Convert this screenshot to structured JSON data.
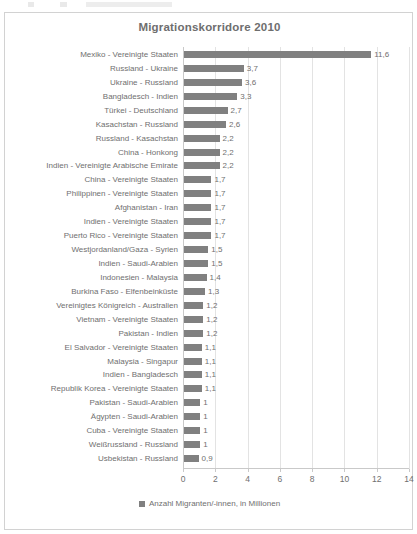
{
  "chart_data": {
    "type": "bar",
    "orientation": "horizontal",
    "title": "Migrationskorridore 2010",
    "xlabel": "",
    "ylabel": "",
    "xlim": [
      0,
      14
    ],
    "xticks": [
      0,
      2,
      4,
      6,
      8,
      10,
      12,
      14
    ],
    "grid": true,
    "legend_position": "bottom",
    "legend": [
      "Anzahl Migranten/-innen, in Millionen"
    ],
    "series_name": "Anzahl Migranten/-innen, in Millionen",
    "bar_color": "#808080",
    "value_decimal_separator": ",",
    "categories": [
      "Mexiko - Vereinigte Staaten",
      "Russland - Ukraine",
      "Ukraine - Russland",
      "Bangladesch - Indien",
      "Türkei - Deutschland",
      "Kasachstan - Russland",
      "Russland - Kasachstan",
      "China - Honkong",
      "Indien - Vereinigte Arabische Emirate",
      "China - Vereinigte Staaten",
      "Philippinen - Vereinigte Staaten",
      "Afghanistan - Iran",
      "Indien - Vereinigte Staaten",
      "Puerto Rico - Vereinigte Staaten",
      "Westjordanland/Gaza - Syrien",
      "Indien - Saudi-Arabien",
      "Indonesien - Malaysia",
      "Burkina Faso - Elfenbeinküste",
      "Vereinigtes Königreich - Australien",
      "Vietnam - Vereinigte Staaten",
      "Pakistan - Indien",
      "El Salvador - Vereinigte Staaten",
      "Malaysia - Singapur",
      "Indien - Bangladesch",
      "Republik Korea - Vereinigte Staaten",
      "Pakistan - Saudi-Arabien",
      "Ägypten - Saudi-Arabien",
      "Cuba - Vereinigte Staaten",
      "Weißrussland - Russland",
      "Usbekistan - Russland"
    ],
    "values": [
      11.6,
      3.7,
      3.6,
      3.3,
      2.7,
      2.6,
      2.2,
      2.2,
      2.2,
      1.7,
      1.7,
      1.7,
      1.7,
      1.7,
      1.5,
      1.5,
      1.4,
      1.3,
      1.2,
      1.2,
      1.2,
      1.1,
      1.1,
      1.1,
      1.1,
      1,
      1,
      1,
      1,
      0.9
    ],
    "value_labels": [
      "11,6",
      "3,7",
      "3,6",
      "3,3",
      "2,7",
      "2,6",
      "2,2",
      "2,2",
      "2,2",
      "1,7",
      "1,7",
      "1,7",
      "1,7",
      "1,7",
      "1,5",
      "1,5",
      "1,4",
      "1,3",
      "1,2",
      "1,2",
      "1,2",
      "1,1",
      "1,1",
      "1,1",
      "1,1",
      "1",
      "1",
      "1",
      "1",
      "0,9"
    ]
  }
}
